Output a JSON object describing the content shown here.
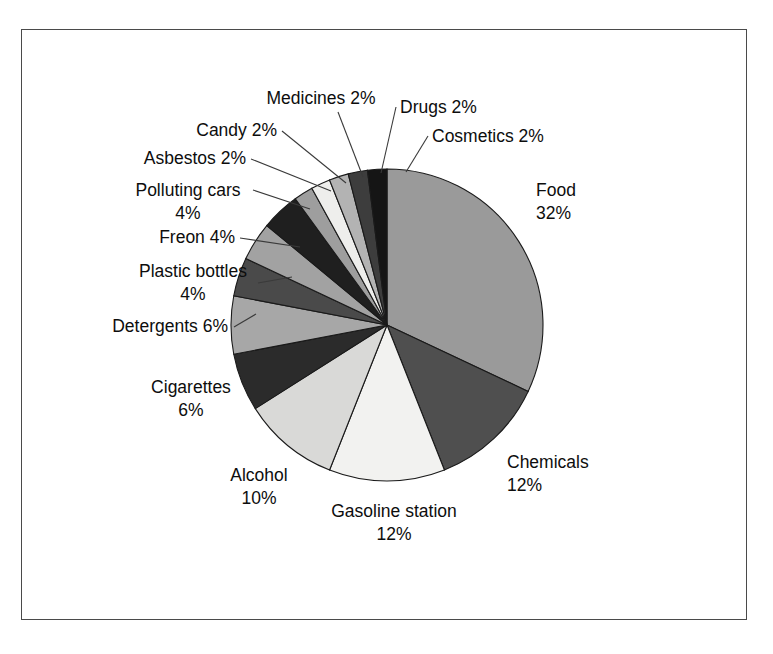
{
  "chart_data": {
    "type": "pie",
    "title": "",
    "subtitle": "",
    "xlabel": "",
    "ylabel": "",
    "legend_position": "none",
    "grid": false,
    "units": "percent",
    "total": 100,
    "start_angle_deg": 0,
    "direction": "clockwise",
    "categories": [
      "Food",
      "Chemicals",
      "Gasoline station",
      "Alcohol",
      "Cigarettes",
      "Detergents",
      "Plastic bottles",
      "Freon",
      "Polluting cars",
      "Asbestos",
      "Candy",
      "Medicines",
      "Drugs",
      "Cosmetics"
    ],
    "values": [
      32,
      12,
      12,
      10,
      6,
      6,
      4,
      4,
      4,
      2,
      2,
      2,
      2,
      2
    ],
    "slices": [
      {
        "label": "Food",
        "value": 32,
        "value_text": "32%",
        "label_text": "Food",
        "color": "#9a9a9a"
      },
      {
        "label": "Chemicals",
        "value": 12,
        "value_text": "12%",
        "label_text": "Chemicals",
        "color": "#4f4f4f"
      },
      {
        "label": "Gasoline station",
        "value": 12,
        "value_text": "12%",
        "label_text": "Gasoline station",
        "color": "#f2f2f0"
      },
      {
        "label": "Alcohol",
        "value": 10,
        "value_text": "10%",
        "label_text": "Alcohol",
        "color": "#d9d9d7"
      },
      {
        "label": "Cigarettes",
        "value": 6,
        "value_text": "6%",
        "label_text": "Cigarettes",
        "color": "#2b2b2b"
      },
      {
        "label": "Detergents",
        "value": 6,
        "value_text": "6%",
        "label_text": "Detergents",
        "color": "#a7a7a7"
      },
      {
        "label": "Plastic bottles",
        "value": 4,
        "value_text": "4%",
        "label_text": "Plastic bottles",
        "color": "#4a4a4a"
      },
      {
        "label": "Freon",
        "value": 4,
        "value_text": "4%",
        "label_text": "Freon",
        "color": "#a2a2a2"
      },
      {
        "label": "Polluting cars",
        "value": 4,
        "value_text": "4%",
        "label_text": "Polluting cars",
        "color": "#1f1f1f"
      },
      {
        "label": "Asbestos",
        "value": 2,
        "value_text": "2%",
        "label_text": "Asbestos",
        "color": "#9e9e9e"
      },
      {
        "label": "Candy",
        "value": 2,
        "value_text": "2%",
        "label_text": "Candy",
        "color": "#eeeeec"
      },
      {
        "label": "Medicines",
        "value": 2,
        "value_text": "2%",
        "label_text": "Medicines",
        "color": "#b3b3b3"
      },
      {
        "label": "Drugs",
        "value": 2,
        "value_text": "2%",
        "label_text": "Drugs",
        "color": "#3d3d3d"
      },
      {
        "label": "Cosmetics",
        "value": 2,
        "value_text": "2%",
        "label_text": "Cosmetics",
        "color": "#151515"
      }
    ]
  },
  "labels": [
    {
      "name": "food",
      "lines": [
        "Food",
        "32%"
      ],
      "x": 536,
      "y": 196,
      "anchor": "start",
      "leader": null
    },
    {
      "name": "chemicals",
      "lines": [
        "Chemicals",
        "12%"
      ],
      "x": 507,
      "y": 468,
      "anchor": "start",
      "leader": null
    },
    {
      "name": "gasoline-station",
      "lines": [
        "Gasoline station",
        "12%"
      ],
      "x": 394,
      "y": 517,
      "anchor": "middle",
      "leader": null
    },
    {
      "name": "alcohol",
      "lines": [
        "Alcohol",
        "10%"
      ],
      "x": 259,
      "y": 481,
      "anchor": "middle",
      "leader": null
    },
    {
      "name": "cigarettes",
      "lines": [
        "Cigarettes",
        "6%"
      ],
      "x": 191,
      "y": 393,
      "anchor": "middle",
      "leader": null
    },
    {
      "name": "detergents",
      "lines": [
        "Detergents 6%"
      ],
      "x": 228,
      "y": 332,
      "anchor": "end",
      "leader": [
        [
          234,
          327
        ],
        [
          256,
          314
        ]
      ]
    },
    {
      "name": "plastic-bottles",
      "lines": [
        "Plastic bottles",
        "4%"
      ],
      "x": 193,
      "y": 277,
      "anchor": "middle",
      "leader": [
        [
          258,
          283
        ],
        [
          292,
          277
        ]
      ]
    },
    {
      "name": "freon",
      "lines": [
        "Freon 4%"
      ],
      "x": 235,
      "y": 243,
      "anchor": "end",
      "leader": [
        [
          240,
          238
        ],
        [
          300,
          247
        ]
      ]
    },
    {
      "name": "polluting-cars",
      "lines": [
        "Polluting cars",
        "4%"
      ],
      "x": 188,
      "y": 196,
      "anchor": "middle",
      "leader": [
        [
          253,
          190
        ],
        [
          310,
          209
        ]
      ]
    },
    {
      "name": "asbestos",
      "lines": [
        "Asbestos 2%"
      ],
      "x": 246,
      "y": 164,
      "anchor": "end",
      "leader": [
        [
          251,
          159
        ],
        [
          331,
          191
        ]
      ]
    },
    {
      "name": "candy",
      "lines": [
        "Candy 2%"
      ],
      "x": 277,
      "y": 136,
      "anchor": "end",
      "leader": [
        [
          282,
          131
        ],
        [
          346,
          183
        ]
      ]
    },
    {
      "name": "medicines",
      "lines": [
        "Medicines 2%"
      ],
      "x": 321,
      "y": 104,
      "anchor": "middle",
      "leader": [
        [
          338,
          112
        ],
        [
          363,
          177
        ]
      ]
    },
    {
      "name": "drugs",
      "lines": [
        "Drugs 2%"
      ],
      "x": 400,
      "y": 113,
      "anchor": "start",
      "leader": [
        [
          396,
          107
        ],
        [
          381,
          173
        ]
      ]
    },
    {
      "name": "cosmetics",
      "lines": [
        "Cosmetics 2%"
      ],
      "x": 432,
      "y": 142,
      "anchor": "start",
      "leader": [
        [
          428,
          136
        ],
        [
          406,
          172
        ]
      ]
    }
  ],
  "geometry": {
    "center_x": 387,
    "center_y": 325,
    "radius": 156
  },
  "frame": {
    "stroke": "#4a4a4a"
  }
}
